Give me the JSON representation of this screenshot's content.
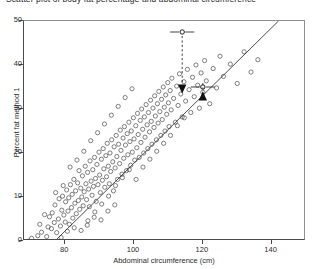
{
  "caption": {
    "text": "Scatter plot of body fat percentage and abdominal circumference"
  },
  "chart_data": {
    "type": "scatter",
    "title": "",
    "xlabel": "Abdominal circumference (cm)",
    "ylabel": "Percent fat method 1",
    "xlim": [
      68,
      150
    ],
    "ylim": [
      0,
      50
    ],
    "xticks": [
      80,
      100,
      120,
      140
    ],
    "yticks": [
      0,
      10,
      20,
      30,
      40,
      50
    ],
    "grid": false,
    "legend": "none",
    "marker": "open-circle",
    "marker_color": "#4a4a4a",
    "regression_line": {
      "label": "fitted regression line",
      "color": "#3a3a3a",
      "x_start": 77,
      "y_start": 0,
      "x_end": 142,
      "y_end": 50
    },
    "annotations": [
      {
        "name": "upper-marker",
        "x": 114,
        "y": 47.5,
        "x_error": 3.5,
        "arrow": "down",
        "arrow_target_y": 33.5
      },
      {
        "name": "lower-marker",
        "x": 120,
        "y": 35.0,
        "x_error": 3.5,
        "arrow": "up",
        "arrow_target_y": 34.0
      }
    ],
    "points": [
      [
        69.4,
        0.0
      ],
      [
        70.2,
        0.6
      ],
      [
        72.0,
        1.2
      ],
      [
        73.1,
        2.0
      ],
      [
        74.6,
        1.0
      ],
      [
        75.0,
        3.2
      ],
      [
        75.4,
        5.5
      ],
      [
        76.0,
        2.8
      ],
      [
        76.2,
        6.4
      ],
      [
        76.8,
        4.2
      ],
      [
        77.0,
        8.2
      ],
      [
        77.5,
        1.9
      ],
      [
        78.0,
        5.0
      ],
      [
        78.2,
        9.6
      ],
      [
        78.6,
        3.4
      ],
      [
        79.0,
        7.0
      ],
      [
        79.2,
        10.2
      ],
      [
        79.6,
        5.9
      ],
      [
        80.0,
        4.3
      ],
      [
        80.1,
        8.9
      ],
      [
        80.4,
        11.6
      ],
      [
        80.8,
        6.8
      ],
      [
        81.0,
        9.8
      ],
      [
        81.2,
        3.8
      ],
      [
        81.5,
        12.8
      ],
      [
        81.8,
        7.6
      ],
      [
        82.0,
        10.6
      ],
      [
        82.2,
        5.2
      ],
      [
        82.5,
        14.0
      ],
      [
        82.8,
        8.6
      ],
      [
        83.0,
        11.4
      ],
      [
        83.2,
        6.2
      ],
      [
        83.6,
        13.2
      ],
      [
        83.8,
        9.2
      ],
      [
        84.0,
        16.0
      ],
      [
        84.2,
        7.2
      ],
      [
        84.5,
        12.0
      ],
      [
        84.8,
        10.0
      ],
      [
        85.0,
        14.8
      ],
      [
        85.2,
        8.0
      ],
      [
        85.5,
        11.2
      ],
      [
        85.8,
        17.0
      ],
      [
        86.0,
        13.0
      ],
      [
        86.2,
        9.4
      ],
      [
        86.5,
        15.6
      ],
      [
        86.8,
        11.8
      ],
      [
        87.0,
        7.8
      ],
      [
        87.2,
        18.2
      ],
      [
        87.5,
        13.6
      ],
      [
        87.8,
        10.4
      ],
      [
        88.0,
        16.2
      ],
      [
        88.2,
        12.4
      ],
      [
        88.5,
        19.0
      ],
      [
        88.8,
        14.2
      ],
      [
        89.0,
        9.0
      ],
      [
        89.2,
        17.4
      ],
      [
        89.5,
        12.8
      ],
      [
        89.8,
        20.2
      ],
      [
        90.0,
        15.0
      ],
      [
        90.2,
        11.0
      ],
      [
        90.5,
        18.6
      ],
      [
        90.8,
        13.8
      ],
      [
        91.0,
        21.0
      ],
      [
        91.2,
        16.4
      ],
      [
        91.5,
        12.2
      ],
      [
        91.8,
        19.4
      ],
      [
        92.0,
        14.6
      ],
      [
        92.2,
        22.2
      ],
      [
        92.5,
        17.0
      ],
      [
        92.8,
        13.0
      ],
      [
        93.0,
        20.0
      ],
      [
        93.2,
        15.8
      ],
      [
        93.5,
        23.0
      ],
      [
        93.8,
        18.0
      ],
      [
        94.0,
        11.4
      ],
      [
        94.2,
        21.4
      ],
      [
        94.5,
        16.6
      ],
      [
        94.8,
        24.0
      ],
      [
        95.0,
        19.2
      ],
      [
        95.2,
        14.0
      ],
      [
        95.5,
        22.0
      ],
      [
        95.8,
        17.6
      ],
      [
        96.0,
        25.2
      ],
      [
        96.2,
        20.6
      ],
      [
        96.5,
        15.2
      ],
      [
        96.8,
        23.4
      ],
      [
        97.0,
        18.8
      ],
      [
        97.2,
        26.0
      ],
      [
        97.5,
        21.8
      ],
      [
        97.8,
        16.0
      ],
      [
        98.0,
        24.4
      ],
      [
        98.2,
        19.6
      ],
      [
        98.5,
        27.0
      ],
      [
        98.8,
        22.6
      ],
      [
        99.0,
        17.2
      ],
      [
        99.2,
        25.0
      ],
      [
        99.5,
        20.2
      ],
      [
        99.8,
        28.0
      ],
      [
        100.0,
        23.2
      ],
      [
        100.2,
        18.4
      ],
      [
        100.5,
        26.2
      ],
      [
        100.8,
        21.2
      ],
      [
        101.0,
        29.0
      ],
      [
        101.2,
        24.2
      ],
      [
        101.5,
        19.0
      ],
      [
        101.8,
        27.4
      ],
      [
        102.0,
        22.4
      ],
      [
        102.2,
        30.0
      ],
      [
        102.5,
        25.4
      ],
      [
        102.8,
        20.0
      ],
      [
        103.0,
        28.2
      ],
      [
        103.2,
        23.6
      ],
      [
        103.5,
        31.0
      ],
      [
        103.8,
        26.4
      ],
      [
        104.0,
        21.0
      ],
      [
        104.2,
        29.2
      ],
      [
        104.5,
        24.8
      ],
      [
        104.8,
        32.0
      ],
      [
        105.0,
        27.2
      ],
      [
        105.2,
        22.0
      ],
      [
        105.5,
        30.2
      ],
      [
        105.8,
        25.8
      ],
      [
        106.0,
        33.0
      ],
      [
        106.2,
        28.4
      ],
      [
        106.5,
        23.0
      ],
      [
        106.8,
        31.2
      ],
      [
        107.0,
        26.8
      ],
      [
        107.2,
        34.0
      ],
      [
        107.5,
        29.4
      ],
      [
        107.8,
        24.0
      ],
      [
        108.0,
        32.2
      ],
      [
        108.2,
        27.6
      ],
      [
        108.5,
        35.0
      ],
      [
        108.8,
        30.4
      ],
      [
        109.0,
        25.0
      ],
      [
        109.2,
        33.2
      ],
      [
        109.5,
        28.8
      ],
      [
        109.8,
        36.0
      ],
      [
        110.0,
        31.4
      ],
      [
        110.2,
        26.0
      ],
      [
        110.5,
        34.2
      ],
      [
        110.8,
        29.8
      ],
      [
        111.0,
        37.0
      ],
      [
        111.5,
        32.4
      ],
      [
        112.0,
        27.0
      ],
      [
        112.4,
        35.2
      ],
      [
        112.8,
        30.8
      ],
      [
        113.2,
        38.0
      ],
      [
        113.6,
        33.4
      ],
      [
        114.0,
        28.2
      ],
      [
        114.5,
        36.2
      ],
      [
        115.0,
        31.8
      ],
      [
        115.5,
        39.0
      ],
      [
        116.0,
        34.4
      ],
      [
        116.5,
        29.2
      ],
      [
        117.0,
        37.2
      ],
      [
        117.5,
        32.8
      ],
      [
        118.0,
        40.0
      ],
      [
        118.5,
        35.4
      ],
      [
        119.0,
        30.2
      ],
      [
        119.5,
        38.2
      ],
      [
        120.0,
        33.8
      ],
      [
        120.5,
        41.0
      ],
      [
        121.0,
        36.4
      ],
      [
        122.0,
        31.2
      ],
      [
        123.0,
        39.2
      ],
      [
        124.0,
        34.8
      ],
      [
        125.0,
        42.0
      ],
      [
        126.0,
        37.4
      ],
      [
        128.0,
        40.2
      ],
      [
        130.0,
        35.8
      ],
      [
        132.0,
        43.0
      ],
      [
        134.0,
        38.4
      ],
      [
        136.0,
        41.2
      ],
      [
        72.6,
        3.8
      ],
      [
        74.0,
        6.0
      ],
      [
        77.2,
        11.0
      ],
      [
        79.4,
        12.6
      ],
      [
        81.4,
        16.8
      ],
      [
        83.4,
        18.4
      ],
      [
        85.4,
        20.4
      ],
      [
        87.4,
        22.8
      ],
      [
        89.4,
        24.6
      ],
      [
        91.4,
        26.6
      ],
      [
        93.4,
        28.6
      ],
      [
        95.4,
        30.6
      ],
      [
        97.4,
        32.6
      ],
      [
        99.4,
        34.6
      ],
      [
        86.6,
        4.6
      ],
      [
        88.6,
        6.6
      ],
      [
        90.6,
        8.4
      ],
      [
        92.6,
        10.2
      ],
      [
        94.6,
        12.6
      ],
      [
        96.6,
        14.4
      ],
      [
        98.6,
        16.2
      ],
      [
        100.6,
        14.0
      ],
      [
        102.6,
        16.8
      ],
      [
        104.6,
        18.6
      ],
      [
        106.6,
        20.4
      ],
      [
        108.6,
        22.2
      ],
      [
        110.6,
        24.0
      ],
      [
        112.6,
        26.2
      ],
      [
        114.6,
        28.0
      ],
      [
        78.8,
        0.8
      ],
      [
        80.6,
        2.2
      ],
      [
        82.6,
        3.0
      ],
      [
        84.6,
        2.4
      ],
      [
        86.4,
        3.6
      ],
      [
        88.4,
        5.4
      ],
      [
        90.4,
        4.8
      ],
      [
        92.4,
        6.8
      ],
      [
        94.4,
        8.2
      ]
    ]
  }
}
